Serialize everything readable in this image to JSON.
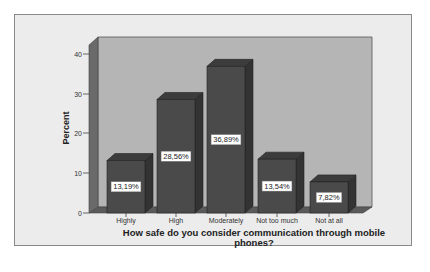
{
  "chart_data": {
    "type": "bar",
    "style": "3d",
    "title": "",
    "categories": [
      "Highly",
      "High",
      "Moderately",
      "Not too much",
      "Not at all"
    ],
    "values": [
      13.19,
      28.56,
      36.89,
      13.54,
      7.82
    ],
    "value_labels": [
      "13,19%",
      "28,56%",
      "36,89%",
      "13,54%",
      "7,82%"
    ],
    "xlabel": "How safe do you consider communication through mobile phones?",
    "xlabel_lines": [
      "How safe do you consider communication through mobile",
      "phones?"
    ],
    "ylabel": "Percent",
    "yticks": [
      "0",
      "10",
      "20",
      "30",
      "40"
    ],
    "ylim": [
      0,
      40
    ],
    "grid": false,
    "legend": null,
    "colors": {
      "bar_front": "#4a4a4a",
      "bar_side": "#333333",
      "bar_top": "#3c3c3c",
      "wall": "#b5b5b5",
      "background": "#ececec"
    }
  }
}
